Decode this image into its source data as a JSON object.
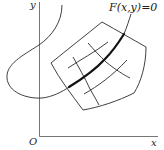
{
  "diagram": {
    "type": "coordinate-sketch",
    "labels": {
      "y_axis": "y",
      "x_axis": "x",
      "origin": "O",
      "curve": "F(x,y)=0"
    },
    "colors": {
      "stroke": "#2a2a2a",
      "axis": "#555555",
      "background": "#ffffff"
    },
    "elements": [
      "x-axis",
      "y-axis",
      "thin S-shaped curve",
      "curvilinear quadrilateral patch with 2x2 interior grid lines",
      "thick segment of curve F(x,y)=0 crossing the patch"
    ]
  }
}
